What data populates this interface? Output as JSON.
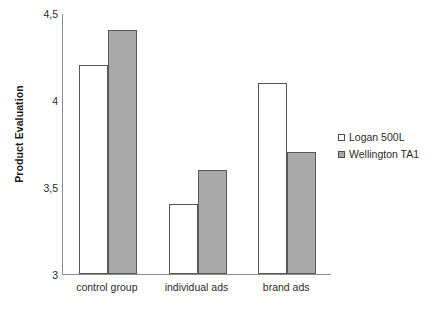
{
  "chart_data": {
    "type": "bar",
    "title": "",
    "subtitle": "",
    "xlabel": "",
    "ylabel": "Product Evaluation",
    "categories": [
      "control group",
      "individual ads",
      "brand ads"
    ],
    "series": [
      {
        "name": "Logan 500L",
        "values": [
          4.2,
          3.4,
          4.1
        ],
        "color": "#ffffff",
        "swatch": "open-square"
      },
      {
        "name": "Wellington TA1",
        "values": [
          4.4,
          3.6,
          3.7
        ],
        "color": "#a9a9a9",
        "swatch": "filled-square"
      }
    ],
    "ylim": [
      3,
      4.5
    ],
    "ytick_values": [
      3,
      3.5,
      4,
      4.5
    ],
    "ytick_labels": [
      "3",
      "3,5",
      "4",
      "4,5"
    ],
    "grid": false,
    "legend_position": "right",
    "decimal_separator": ","
  },
  "axis": {
    "y_title": "Product Evaluation",
    "ticks": [
      {
        "label": "4,5",
        "value": 4.5
      },
      {
        "label": "4",
        "value": 4
      },
      {
        "label": "3,5",
        "value": 3.5
      },
      {
        "label": "3",
        "value": 3
      }
    ]
  },
  "legend": {
    "items": [
      {
        "label": "Logan 500L"
      },
      {
        "label": "Wellington TA1"
      }
    ]
  },
  "x_axis": {
    "labels": [
      "control group",
      "individual ads",
      "brand ads"
    ]
  }
}
